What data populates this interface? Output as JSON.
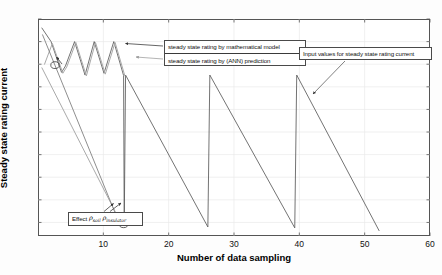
{
  "chart_data": {
    "type": "line",
    "title": "",
    "xlabel": "Number of data sampling",
    "ylabel": "Steady state rating current",
    "xlim": [
      0,
      60
    ],
    "ylim": [
      347,
      395
    ],
    "xticks": [
      10,
      20,
      30,
      40,
      50,
      60
    ],
    "yticks": [
      350,
      355,
      360,
      365,
      370,
      375,
      380,
      385,
      390,
      395
    ],
    "grid": true,
    "legend_position": "inside-top-center",
    "series": [
      {
        "name": "steady state rating by mathematical model",
        "color": "#5a5a5a",
        "points": [
          [
            0.6,
            393.0
          ],
          [
            2.0,
            390.0
          ],
          [
            3.6,
            383.2
          ],
          [
            4.2,
            384.6
          ],
          [
            5.6,
            390.0
          ],
          [
            7.2,
            382.6
          ],
          [
            8.6,
            390.0
          ],
          [
            10.1,
            383.0
          ],
          [
            11.6,
            390.0
          ],
          [
            13.1,
            382.5
          ],
          [
            13.2,
            349.2
          ],
          [
            13.4,
            382.6
          ],
          [
            26.0,
            349.0
          ],
          [
            26.3,
            382.6
          ],
          [
            39.3,
            348.8
          ],
          [
            39.6,
            382.6
          ],
          [
            52.2,
            348.2
          ]
        ]
      },
      {
        "name": "steady state rating by (ANN) prediction",
        "color": "#a9a9a9",
        "points": [
          [
            1.0,
            385.0
          ],
          [
            2.2,
            389.6
          ],
          [
            3.8,
            383.0
          ],
          [
            4.4,
            384.4
          ],
          [
            5.8,
            389.8
          ],
          [
            7.4,
            382.4
          ],
          [
            8.8,
            389.8
          ],
          [
            10.3,
            382.8
          ],
          [
            11.8,
            389.8
          ],
          [
            13.3,
            382.4
          ]
        ]
      },
      {
        "name": "input values for steady state rating current",
        "color": "#7a7a7a",
        "points": [
          [
            0.7,
            391.5
          ],
          [
            12.6,
            349.3
          ]
        ]
      },
      {
        "name": "input values for steady state rating current (second)",
        "color": "#9a9a9a",
        "points": [
          [
            0.6,
            384.2
          ],
          [
            12.9,
            349.3
          ]
        ]
      }
    ],
    "markers": [
      {
        "label": "marker-upper",
        "x": 2.6,
        "y": 384.8
      },
      {
        "label": "marker-lower",
        "x": 13.1,
        "y": 349.6
      }
    ]
  },
  "legend": {
    "items": [
      {
        "label": "steady state rating by mathematical model"
      },
      {
        "label": "steady state rating by (ANN) prediction"
      }
    ]
  },
  "annotations": {
    "input_box": "Input values for steady state rating current",
    "effect_prefix": "Effect",
    "effect_rho1": "ρ",
    "effect_rho1_sub": "soil",
    "effect_rho2": "ρ",
    "effect_rho2_sub": "insulator"
  },
  "axes": {
    "x_title": "Number of data sampling",
    "y_title": "Steady state rating current",
    "x_ticks": [
      "10",
      "20",
      "30",
      "40",
      "50",
      "60"
    ],
    "y_ticks": [
      "350",
      "355",
      "360",
      "365",
      "370",
      "375",
      "380",
      "385",
      "390",
      "395"
    ]
  }
}
